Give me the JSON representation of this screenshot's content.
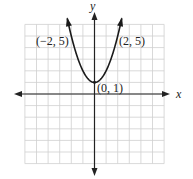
{
  "chart_data": {
    "type": "line",
    "title": "",
    "xlabel": "x",
    "ylabel": "y",
    "xlim": [
      -6,
      6
    ],
    "ylim": [
      -6,
      6
    ],
    "grid": true,
    "equation": "y = x^2 + 1",
    "series": [
      {
        "name": "parabola",
        "x": [
          -2.2,
          -2,
          -1.5,
          -1,
          -0.5,
          0,
          0.5,
          1,
          1.5,
          2,
          2.2
        ],
        "y": [
          5.84,
          5,
          3.25,
          2,
          1.25,
          1,
          1.25,
          2,
          3.25,
          5,
          5.84
        ]
      }
    ],
    "annotations": [
      {
        "text": "(−2, 5)",
        "x": -2,
        "y": 5
      },
      {
        "text": "(2, 5)",
        "x": 2,
        "y": 5
      },
      {
        "text": "(0, 1)",
        "x": 0,
        "y": 1
      }
    ]
  },
  "labels": {
    "x_axis": "x",
    "y_axis": "y",
    "point_left": "(−2, 5)",
    "point_right": "(2, 5)",
    "point_vertex": "(0, 1)"
  }
}
